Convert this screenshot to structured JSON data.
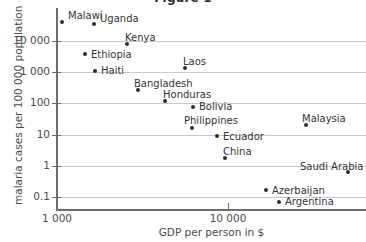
{
  "chart_data": {
    "type": "scatter",
    "title": "Figure 1",
    "xlabel": "GDP per person in $",
    "ylabel": "malaria cases per 100 000 population",
    "xscale": "log",
    "yscale": "log",
    "grid": true,
    "legend": "none",
    "xlim": [
      1000,
      50000
    ],
    "ylim": [
      0.02,
      40000
    ],
    "xticks": [
      {
        "value": 1000,
        "label": "1 000"
      },
      {
        "value": 10000,
        "label": "10 000"
      }
    ],
    "yticks": [
      {
        "value": 10000,
        "label": "10 000"
      },
      {
        "value": 1000,
        "label": "1 000"
      },
      {
        "value": 100,
        "label": "100"
      },
      {
        "value": 10,
        "label": "10"
      },
      {
        "value": 1,
        "label": "1"
      },
      {
        "value": 0.1,
        "label": "0.1"
      }
    ],
    "points": [
      {
        "name": "Malawi",
        "x": 1000,
        "y": 23000,
        "label_dx": 6,
        "label_dy": -12,
        "px": 62,
        "py": 22
      },
      {
        "name": "Uganda",
        "x": 1900,
        "y": 19000,
        "label_dx": 6,
        "label_dy": -11,
        "px": 94,
        "py": 24
      },
      {
        "name": "Kenya",
        "x": 2900,
        "y": 8000,
        "label_dx": -2,
        "label_dy": -12,
        "px": 127,
        "py": 44
      },
      {
        "name": "Ethiopia",
        "x": 1600,
        "y": 4300,
        "label_dx": 6,
        "label_dy": -5,
        "px": 85,
        "py": 54
      },
      {
        "name": "Haiti",
        "x": 1850,
        "y": 1250,
        "label_dx": 6,
        "label_dy": -6,
        "px": 95,
        "py": 71
      },
      {
        "name": "Laos",
        "x": 4300,
        "y": 1600,
        "label_dx": -2,
        "label_dy": -12,
        "px": 185,
        "py": 68
      },
      {
        "name": "Bangladesh",
        "x": 2800,
        "y": 400,
        "label_dx": -4,
        "label_dy": -12,
        "px": 138,
        "py": 90
      },
      {
        "name": "Honduras",
        "x": 3800,
        "y": 160,
        "label_dx": -2,
        "label_dy": -12,
        "px": 165,
        "py": 101
      },
      {
        "name": "Bolivia",
        "x": 5200,
        "y": 105,
        "label_dx": 6,
        "label_dy": -6,
        "px": 193,
        "py": 107
      },
      {
        "name": "Philippines",
        "x": 5100,
        "y": 26,
        "label_dx": -8,
        "label_dy": -13,
        "px": 192,
        "py": 128
      },
      {
        "name": "Ecuador",
        "x": 7800,
        "y": 14,
        "label_dx": 6,
        "label_dy": -5,
        "px": 217,
        "py": 136
      },
      {
        "name": "Malaysia",
        "x": 21000,
        "y": 30,
        "label_dx": -4,
        "label_dy": -12,
        "px": 306,
        "py": 125
      },
      {
        "name": "China",
        "x": 9000,
        "y": 1,
        "label_dx": -2,
        "label_dy": -12,
        "px": 225,
        "py": 158
      },
      {
        "name": "Saudi Arabia",
        "x": 26000,
        "y": 0.38,
        "label_dx": -48,
        "label_dy": -11,
        "px": 348,
        "py": 172
      },
      {
        "name": "Azerbaijan",
        "x": 15000,
        "y": 0.05,
        "label_dx": 6,
        "label_dy": -5,
        "px": 266,
        "py": 190
      },
      {
        "name": "Argentina",
        "x": 18000,
        "y": 0.025,
        "label_dx": 6,
        "label_dy": -6,
        "px": 279,
        "py": 202
      }
    ],
    "gridline_y_px": [
      41,
      72,
      103,
      135,
      166,
      197
    ],
    "xtick_px": [
      57,
      228
    ]
  }
}
